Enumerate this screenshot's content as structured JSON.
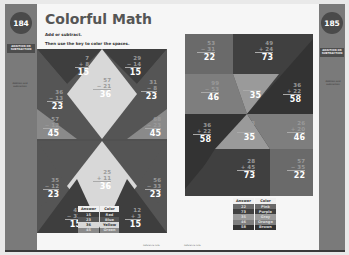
{
  "left_page": {
    "page_number": "184",
    "title": "Colorful Math",
    "instruction_1": "Add or subtract.",
    "instruction_2": "Then use the key to color the spaces.",
    "side_tag": "ADDITION OR SUBTRACTION",
    "side_note": "Addition and subtraction",
    "problems": [
      {
        "top": "7",
        "op": "+",
        "bottom": "8",
        "answer": "15"
      },
      {
        "top": "29",
        "op": "−",
        "bottom": "14",
        "answer": "15"
      },
      {
        "top": "57",
        "op": "−",
        "bottom": "21",
        "answer": "36"
      },
      {
        "top": "36",
        "op": "−",
        "bottom": "13",
        "answer": "23"
      },
      {
        "top": "31",
        "op": "−",
        "bottom": "8",
        "answer": "23"
      },
      {
        "top": "57",
        "op": "−",
        "bottom": "12",
        "answer": "45"
      },
      {
        "top": "68",
        "op": "−",
        "bottom": "23",
        "answer": "45"
      },
      {
        "top": "25",
        "op": "+",
        "bottom": "11",
        "answer": "36"
      },
      {
        "top": "35",
        "op": "−",
        "bottom": "12",
        "answer": "23"
      },
      {
        "top": "56",
        "op": "−",
        "bottom": "33",
        "answer": "23"
      },
      {
        "top": "47",
        "op": "−",
        "bottom": "32",
        "answer": "15"
      },
      {
        "top": "12",
        "op": "+",
        "bottom": "3",
        "answer": "15"
      }
    ],
    "key": {
      "header_answer": "Answer",
      "header_color": "Color",
      "rows": [
        {
          "answer": "15",
          "color": "Red",
          "swatch": "#3e3e3e"
        },
        {
          "answer": "23",
          "color": "Blue",
          "swatch": "#555555"
        },
        {
          "answer": "36",
          "color": "Yellow",
          "swatch": "#d8d8d8"
        },
        {
          "answer": "45",
          "color": "Green",
          "swatch": "#8a8a8a"
        }
      ]
    },
    "footer": "Reference note"
  },
  "right_page": {
    "page_number": "185",
    "side_tag": "ADDITION OR SUBTRACTION",
    "side_note": "Addition and subtraction",
    "problems": [
      {
        "top": "53",
        "op": "−",
        "bottom": "31",
        "answer": "22"
      },
      {
        "top": "49",
        "op": "+",
        "bottom": "24",
        "answer": "73"
      },
      {
        "top": "99",
        "op": "−",
        "bottom": "53",
        "answer": "46"
      },
      {
        "top": "99",
        "op": "−",
        "bottom": "64",
        "answer": "35"
      },
      {
        "top": "36",
        "op": "+",
        "bottom": "22",
        "answer": "58"
      },
      {
        "top": "36",
        "op": "+",
        "bottom": "22",
        "answer": "58"
      },
      {
        "top": "13",
        "op": "+",
        "bottom": "22",
        "answer": "35"
      },
      {
        "top": "26",
        "op": "+",
        "bottom": "20",
        "answer": "46"
      },
      {
        "top": "28",
        "op": "+",
        "bottom": "45",
        "answer": "73"
      },
      {
        "top": "57",
        "op": "−",
        "bottom": "35",
        "answer": "22"
      }
    ],
    "key": {
      "header_answer": "Answer",
      "header_color": "Color",
      "rows": [
        {
          "answer": "22",
          "color": "Pink",
          "swatch": "#6a6a6a"
        },
        {
          "answer": "73",
          "color": "Purple",
          "swatch": "#404040"
        },
        {
          "answer": "35",
          "color": "Gray",
          "swatch": "#9a9a9a"
        },
        {
          "answer": "46",
          "color": "Orange",
          "swatch": "#7e7e7e"
        },
        {
          "answer": "58",
          "color": "Brown",
          "swatch": "#333333"
        }
      ]
    },
    "footer": "Reference note"
  }
}
